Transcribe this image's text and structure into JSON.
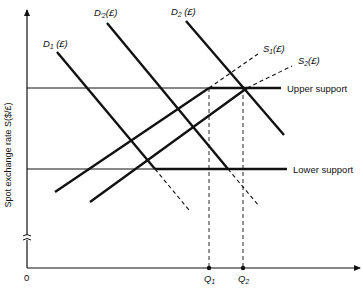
{
  "figure": {
    "y_axis_label": "Spot exchange rate S($/£)",
    "origin_label": "0",
    "x_ticks": [
      {
        "name": "Q",
        "sub": "1"
      },
      {
        "name": "Q",
        "sub": "2"
      }
    ],
    "levels": {
      "upper_support": "Upper support",
      "lower_support": "Lower support"
    },
    "curves": {
      "D1": {
        "name": "D",
        "sub": "1",
        "suffix": " (£)"
      },
      "D2prime": {
        "name": "D",
        "prime_sub": "′2",
        "suffix": "(£)"
      },
      "D2": {
        "name": "D",
        "sub": "2",
        "suffix": " (£)"
      },
      "S1": {
        "name": "S",
        "sub": "1",
        "suffix": "(£)"
      },
      "S2": {
        "name": "S",
        "sub": "2",
        "suffix": "(£)"
      }
    },
    "colors": {
      "ink": "#111111",
      "background": "#ffffff"
    }
  }
}
